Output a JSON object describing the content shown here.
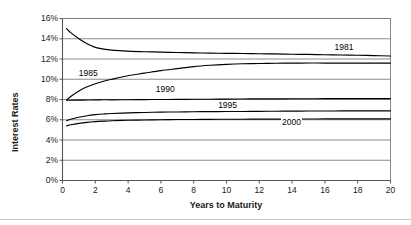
{
  "chart_data": {
    "type": "line",
    "title": "",
    "xlabel": "Years to Maturity",
    "ylabel": "Interest Rates",
    "xlim": [
      0,
      20
    ],
    "ylim": [
      0,
      16
    ],
    "grid": "horizontal",
    "legend_position": "inline-labels",
    "xticks": [
      "0",
      "2",
      "4",
      "6",
      "8",
      "10",
      "12",
      "14",
      "16",
      "18",
      "20"
    ],
    "xtick_values": [
      0,
      2,
      4,
      6,
      8,
      10,
      12,
      14,
      16,
      18,
      20
    ],
    "yticks": [
      "0%",
      "2%",
      "4%",
      "6%",
      "8%",
      "10%",
      "12%",
      "14%",
      "16%"
    ],
    "ytick_values": [
      0,
      2,
      4,
      6,
      8,
      10,
      12,
      14,
      16
    ],
    "x": [
      0.25,
      0.5,
      1,
      1.5,
      2,
      2.5,
      3,
      4,
      5,
      6,
      7,
      8,
      9,
      10,
      11,
      12,
      13,
      14,
      15,
      16,
      17,
      18,
      19,
      20
    ],
    "series": [
      {
        "name": "1981",
        "label": "1981",
        "color": "#000000",
        "label_x": 17.2,
        "label_y": 13.05,
        "values": [
          15.0,
          14.6,
          14.0,
          13.5,
          13.15,
          12.98,
          12.88,
          12.78,
          12.72,
          12.68,
          12.64,
          12.61,
          12.58,
          12.56,
          12.54,
          12.52,
          12.5,
          12.47,
          12.45,
          12.42,
          12.4,
          12.37,
          12.34,
          12.3
        ]
      },
      {
        "name": "1985",
        "label": "1985",
        "color": "#000000",
        "label_x": 1.6,
        "label_y": 10.55,
        "values": [
          7.95,
          8.3,
          8.85,
          9.25,
          9.55,
          9.8,
          10.0,
          10.35,
          10.6,
          10.85,
          11.05,
          11.25,
          11.38,
          11.47,
          11.53,
          11.56,
          11.58,
          11.59,
          11.6,
          11.6,
          11.6,
          11.6,
          11.6,
          11.6
        ]
      },
      {
        "name": "1990",
        "label": "1990",
        "color": "#000000",
        "label_x": 6.3,
        "label_y": 8.9,
        "values": [
          7.92,
          7.93,
          7.94,
          7.95,
          7.96,
          7.97,
          7.97,
          7.98,
          7.99,
          8.0,
          8.01,
          8.02,
          8.03,
          8.04,
          8.05,
          8.06,
          8.06,
          8.07,
          8.07,
          8.08,
          8.08,
          8.08,
          8.09,
          8.09
        ]
      },
      {
        "name": "1995",
        "label": "1995",
        "color": "#000000",
        "label_x": 10.1,
        "label_y": 7.35,
        "values": [
          5.9,
          6.05,
          6.25,
          6.4,
          6.5,
          6.57,
          6.62,
          6.68,
          6.72,
          6.75,
          6.77,
          6.79,
          6.8,
          6.81,
          6.82,
          6.83,
          6.84,
          6.85,
          6.86,
          6.86,
          6.87,
          6.87,
          6.88,
          6.88
        ]
      },
      {
        "name": "2000",
        "label": "2000",
        "color": "#000000",
        "label_x": 14.0,
        "label_y": 5.7,
        "values": [
          5.4,
          5.5,
          5.64,
          5.74,
          5.81,
          5.86,
          5.9,
          5.95,
          5.98,
          6.0,
          6.02,
          6.03,
          6.04,
          6.05,
          6.05,
          6.06,
          6.06,
          6.07,
          6.07,
          6.08,
          6.08,
          6.08,
          6.09,
          6.09
        ]
      }
    ]
  },
  "style": {
    "grid_color": "#808080",
    "axis_color": "#555555",
    "line_color": "#111111",
    "text_color": "#1a1a1a",
    "background": "#ffffff"
  }
}
